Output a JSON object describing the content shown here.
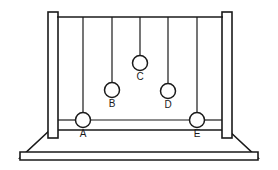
{
  "figure": {
    "name": "newtons-cradle-diagram",
    "line_color": "#1a1a1a",
    "fill_color": "#ffffff",
    "background_color": "#ffffff"
  },
  "frame": {
    "left_post": {
      "x": 48,
      "y": 12,
      "width": 10,
      "height": 126
    },
    "right_post": {
      "x": 222,
      "y": 12,
      "width": 10,
      "height": 126
    },
    "top_rail": {
      "x1": 57,
      "y1": 17,
      "x2": 223,
      "y2": 17
    },
    "rest_line": {
      "x1": 58,
      "y1": 120,
      "x2": 222,
      "y2": 120
    }
  },
  "base": {
    "outline_points": "50,130 228,130 258,158 20,158",
    "front_bar_points": "20,152 258,152 258,160 20,160",
    "top_edge_y": 130,
    "bottom_edge_y": 160
  },
  "balls": [
    {
      "label": "A",
      "cx": 83,
      "cy": 120,
      "r": 7.5,
      "string_top_y": 17,
      "label_x": 83,
      "label_y": 137
    },
    {
      "label": "B",
      "cx": 112,
      "cy": 90,
      "r": 7.5,
      "string_top_y": 17,
      "label_x": 112,
      "label_y": 107
    },
    {
      "label": "C",
      "cx": 140,
      "cy": 63,
      "r": 7.5,
      "string_top_y": 17,
      "label_x": 140,
      "label_y": 80
    },
    {
      "label": "D",
      "cx": 168,
      "cy": 91,
      "r": 7.5,
      "string_top_y": 17,
      "label_x": 168,
      "label_y": 108
    },
    {
      "label": "E",
      "cx": 197,
      "cy": 120,
      "r": 7.5,
      "string_top_y": 17,
      "label_x": 197,
      "label_y": 137
    }
  ],
  "ball_count": 5,
  "labels_text": {
    "a": "A",
    "b": "B",
    "c": "C",
    "d": "D",
    "e": "E"
  }
}
